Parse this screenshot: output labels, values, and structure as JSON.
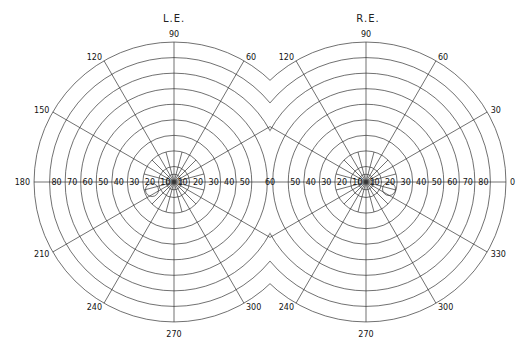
{
  "titles": {
    "left": "L.E.",
    "right": "R.E."
  },
  "geometry": {
    "left_center": [
      174,
      182
    ],
    "right_center": [
      366,
      182
    ],
    "ring_step_px": 15.55,
    "ring_degrees": [
      10,
      20,
      30,
      40,
      50,
      60,
      70,
      80,
      90
    ],
    "inner_ring_degrees": 5,
    "midline_x": 270
  },
  "left_field": {
    "meridian_labels": [
      {
        "angle": 90,
        "text": "90"
      },
      {
        "angle": 120,
        "text": "120"
      },
      {
        "angle": 150,
        "text": "150"
      },
      {
        "angle": 180,
        "text": "180"
      },
      {
        "angle": 210,
        "text": "210"
      },
      {
        "angle": 240,
        "text": "240"
      },
      {
        "angle": 270,
        "text": "270"
      },
      {
        "angle": 300,
        "text": "300"
      },
      {
        "angle": 60,
        "text": "60"
      }
    ],
    "axis_labels_left": [
      "80",
      "70",
      "60",
      "50",
      "40",
      "30",
      "20",
      "10"
    ],
    "axis_labels_right": [
      "10",
      "20",
      "30",
      "40",
      "50"
    ],
    "blind_spot": [
      152,
      190,
      6.5
    ]
  },
  "shared_midline_label": "60",
  "right_field": {
    "meridian_labels": [
      {
        "angle": 90,
        "text": "90"
      },
      {
        "angle": 120,
        "text": "120"
      },
      {
        "angle": 60,
        "text": "60"
      },
      {
        "angle": 30,
        "text": "30"
      },
      {
        "angle": 0,
        "text": "0"
      },
      {
        "angle": 330,
        "text": "330"
      },
      {
        "angle": 300,
        "text": "300"
      },
      {
        "angle": 270,
        "text": "270"
      },
      {
        "angle": 240,
        "text": "240"
      }
    ],
    "axis_labels_left": [
      "50",
      "40",
      "30",
      "20",
      "10"
    ],
    "axis_labels_right": [
      "10",
      "20",
      "30",
      "40",
      "50",
      "60",
      "70",
      "80"
    ],
    "blind_spot": [
      389,
      189,
      6.5
    ]
  }
}
